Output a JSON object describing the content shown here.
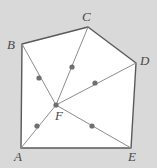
{
  "figure": {
    "kind": "geometry-diagram",
    "canvas": {
      "width": 157,
      "height": 168
    },
    "colors": {
      "background": "#d9d9d9",
      "polygon_fill": "#ffffff",
      "polygon_stroke": "#5a5a5a",
      "cevian_stroke": "#8c8c8c",
      "point_fill": "#6f6f6f",
      "label_color": "#4a4a4a"
    },
    "stroke_widths": {
      "polygon": 1.4,
      "cevian": 1.0
    },
    "vertices": [
      {
        "id": "A",
        "label": "A",
        "x": 21,
        "y": 148,
        "label_x": 14,
        "label_y": 150
      },
      {
        "id": "B",
        "label": "B",
        "x": 22,
        "y": 44,
        "label_x": 7,
        "label_y": 38
      },
      {
        "id": "C",
        "label": "C",
        "x": 88,
        "y": 27,
        "label_x": 82,
        "label_y": 10
      },
      {
        "id": "D",
        "label": "D",
        "x": 136,
        "y": 63,
        "label_x": 140,
        "label_y": 54
      },
      {
        "id": "E",
        "label": "E",
        "x": 131,
        "y": 148,
        "label_x": 128,
        "label_y": 150
      }
    ],
    "interior_point": {
      "id": "F",
      "label": "F",
      "x": 56,
      "y": 105,
      "label_x": 55,
      "label_y": 109
    },
    "polygon_order": [
      "A",
      "B",
      "C",
      "D",
      "E"
    ],
    "cevians": [
      {
        "from": "F",
        "to": "A",
        "marker": {
          "x": 37,
          "y": 126
        }
      },
      {
        "from": "F",
        "to": "B",
        "marker": {
          "x": 39,
          "y": 78
        }
      },
      {
        "from": "F",
        "to": "C",
        "marker": {
          "x": 72,
          "y": 67
        }
      },
      {
        "from": "F",
        "to": "D",
        "marker": {
          "x": 95,
          "y": 83
        }
      },
      {
        "from": "F",
        "to": "E",
        "marker": {
          "x": 92,
          "y": 126
        }
      }
    ],
    "marker_radius": 2.6,
    "vertex_dot_radius": 2.6
  }
}
